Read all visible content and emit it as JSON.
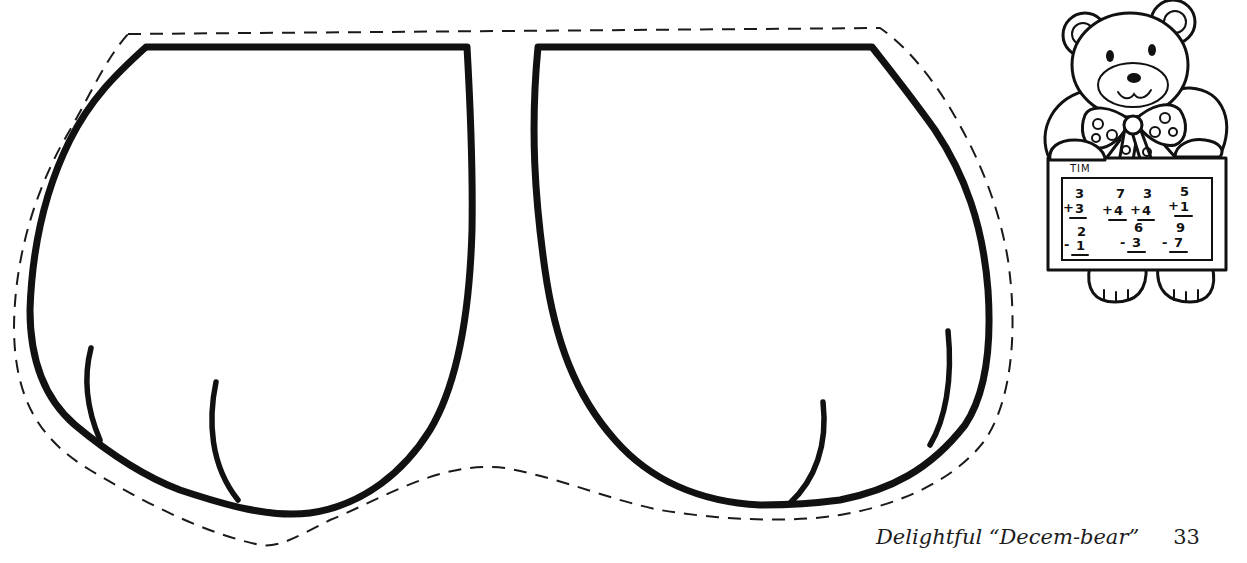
{
  "page": {
    "type": "craft pattern"
  },
  "pattern": {
    "pieces": [
      {
        "label": "left-mitten",
        "outline": "solid",
        "cut_line": "dashed"
      },
      {
        "label": "right-mitten",
        "outline": "solid",
        "cut_line": "dashed"
      }
    ]
  },
  "bear_illustration": {
    "board": {
      "name": "TIM",
      "problems": [
        {
          "top": "3",
          "op": "+",
          "bottom": "3"
        },
        {
          "top": "7",
          "op": "+",
          "bottom": "4"
        },
        {
          "top": "3",
          "op": "+",
          "bottom": "4"
        },
        {
          "top": "5",
          "op": "+",
          "bottom": "1"
        },
        {
          "top": "2",
          "op": "-",
          "bottom": "1"
        },
        {
          "top": "6",
          "op": "-",
          "bottom": "3"
        },
        {
          "top": "9",
          "op": "-",
          "bottom": "7"
        }
      ]
    }
  },
  "footer": {
    "title": "Delightful “Decem-bear”",
    "page_number": "33"
  },
  "colors": {
    "ink": "#111111",
    "paper": "#ffffff"
  }
}
